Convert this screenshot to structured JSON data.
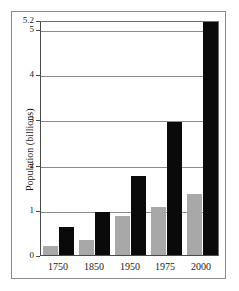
{
  "chart_data": {
    "type": "bar",
    "title": "",
    "xlabel": "",
    "ylabel": "Population (billions)",
    "categories": [
      "1750",
      "1850",
      "1950",
      "1975",
      "2000"
    ],
    "ylim": [
      0,
      5.2
    ],
    "yticks": [
      "0",
      "1",
      "2",
      "3",
      "4",
      "5",
      "5.2"
    ],
    "ytick_values": [
      0,
      1,
      2,
      3,
      4,
      5,
      5.2
    ],
    "grid": true,
    "legend": "none",
    "series": [
      {
        "name": "series-gray",
        "color": "#a8a8a8",
        "values": [
          0.19,
          0.33,
          0.87,
          1.07,
          1.35
        ]
      },
      {
        "name": "series-black",
        "color": "#0a0a0a",
        "values": [
          0.63,
          0.96,
          1.75,
          2.95,
          5.15
        ]
      }
    ]
  }
}
